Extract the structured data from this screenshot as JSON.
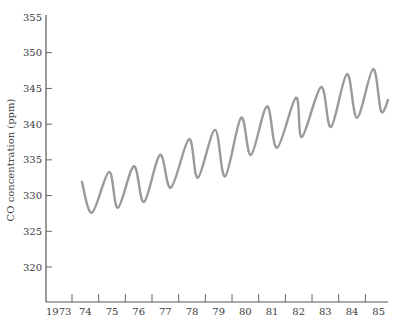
{
  "chart_data": {
    "type": "line",
    "title": "",
    "xlabel": "",
    "ylabel": "CO concentration (ppm)",
    "xlim": [
      1973,
      1986
    ],
    "ylim": [
      315,
      355
    ],
    "y_ticks": [
      {
        "value": 355,
        "label": "355"
      },
      {
        "value": 350,
        "label": "350"
      },
      {
        "value": 345,
        "label": "345"
      },
      {
        "value": 340,
        "label": "340"
      },
      {
        "value": 335,
        "label": "335"
      },
      {
        "value": 330,
        "label": "330"
      },
      {
        "value": 325,
        "label": "325"
      },
      {
        "value": 320,
        "label": "320"
      }
    ],
    "x_tick_marks": [
      1974,
      1975,
      1976,
      1977,
      1978,
      1979,
      1980,
      1981,
      1982,
      1983,
      1984,
      1985
    ],
    "x_labels": [
      {
        "year": 1973,
        "label": "1973"
      },
      {
        "year": 1974,
        "label": "74"
      },
      {
        "year": 1975,
        "label": "75"
      },
      {
        "year": 1976,
        "label": "76"
      },
      {
        "year": 1977,
        "label": "77"
      },
      {
        "year": 1978,
        "label": "78"
      },
      {
        "year": 1979,
        "label": "79"
      },
      {
        "year": 1980,
        "label": "80"
      },
      {
        "year": 1981,
        "label": "81"
      },
      {
        "year": 1982,
        "label": "82"
      },
      {
        "year": 1983,
        "label": "83"
      },
      {
        "year": 1984,
        "label": "84"
      },
      {
        "year": 1985,
        "label": "85"
      }
    ],
    "grid": false,
    "legend": "none",
    "series": [
      {
        "name": "CO concentration",
        "color": "#9a9a9a",
        "points": [
          [
            1974.37,
            331.9
          ],
          [
            1974.75,
            327.6
          ],
          [
            1975.39,
            333.3
          ],
          [
            1975.72,
            328.3
          ],
          [
            1976.32,
            334.1
          ],
          [
            1976.7,
            329.1
          ],
          [
            1977.3,
            335.7
          ],
          [
            1977.71,
            331.1
          ],
          [
            1978.39,
            337.9
          ],
          [
            1978.72,
            332.5
          ],
          [
            1979.36,
            339.2
          ],
          [
            1979.74,
            332.7
          ],
          [
            1980.34,
            340.9
          ],
          [
            1980.71,
            335.7
          ],
          [
            1981.31,
            342.5
          ],
          [
            1981.69,
            336.7
          ],
          [
            1982.4,
            343.7
          ],
          [
            1982.62,
            338.2
          ],
          [
            1983.34,
            345.2
          ],
          [
            1983.71,
            339.6
          ],
          [
            1984.31,
            347.0
          ],
          [
            1984.69,
            340.9
          ],
          [
            1985.29,
            347.7
          ],
          [
            1985.59,
            341.8
          ],
          [
            1985.85,
            343.4
          ]
        ]
      }
    ]
  }
}
